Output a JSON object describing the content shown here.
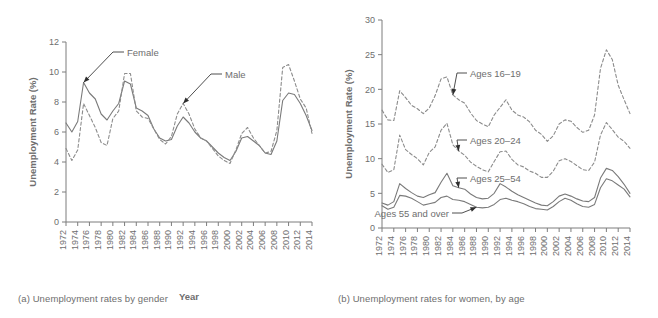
{
  "figure": {
    "panels": [
      {
        "id": "a",
        "caption": "(a) Unemployment rates by gender"
      },
      {
        "id": "b",
        "caption": "(b) Unemployment rates for women, by age"
      }
    ]
  },
  "chart_data": [
    {
      "type": "line",
      "panel": "a",
      "title": "(a) Unemployment rates by gender",
      "xlabel": "Year",
      "ylabel": "Unemployment Rate (%)",
      "xlim": [
        1972,
        2014
      ],
      "ylim": [
        0,
        12
      ],
      "yticks": [
        0,
        2,
        4,
        6,
        8,
        10,
        12
      ],
      "xticks": [
        1972,
        1974,
        1976,
        1978,
        1980,
        1982,
        1984,
        1986,
        1988,
        1990,
        1992,
        1994,
        1996,
        1998,
        2000,
        2002,
        2004,
        2006,
        2008,
        2010,
        2012,
        2014
      ],
      "grid": false,
      "legend": "inline-annotations",
      "annotations": [
        {
          "text": "Female",
          "series": "Female",
          "year": 1975
        },
        {
          "text": "Male",
          "series": "Male",
          "year": 1992
        }
      ],
      "x": [
        1972,
        1973,
        1974,
        1975,
        1976,
        1977,
        1978,
        1979,
        1980,
        1981,
        1982,
        1983,
        1984,
        1985,
        1986,
        1987,
        1988,
        1989,
        1990,
        1991,
        1992,
        1993,
        1994,
        1995,
        1996,
        1997,
        1998,
        1999,
        2000,
        2001,
        2002,
        2003,
        2004,
        2005,
        2006,
        2007,
        2008,
        2009,
        2010,
        2011,
        2012,
        2013,
        2014
      ],
      "series": [
        {
          "name": "Female",
          "style": "solid",
          "values": [
            6.6,
            6.0,
            6.7,
            9.3,
            8.6,
            8.2,
            7.2,
            6.8,
            7.4,
            7.9,
            9.4,
            9.2,
            7.6,
            7.4,
            7.1,
            6.2,
            5.6,
            5.4,
            5.5,
            6.4,
            7.0,
            6.6,
            6.0,
            5.6,
            5.4,
            5.0,
            4.6,
            4.3,
            4.1,
            4.7,
            5.6,
            5.7,
            5.4,
            5.1,
            4.6,
            4.5,
            5.4,
            8.1,
            8.6,
            8.5,
            7.9,
            7.1,
            6.1
          ]
        },
        {
          "name": "Male",
          "style": "dashed",
          "values": [
            4.9,
            4.1,
            4.8,
            7.9,
            7.1,
            6.3,
            5.3,
            5.1,
            6.9,
            7.4,
            9.9,
            9.9,
            7.4,
            7.0,
            6.9,
            6.2,
            5.5,
            5.2,
            5.7,
            7.2,
            7.9,
            7.2,
            6.2,
            5.6,
            5.4,
            4.9,
            4.4,
            4.1,
            3.9,
            4.8,
            5.9,
            6.3,
            5.6,
            5.1,
            4.6,
            4.7,
            6.1,
            10.3,
            10.5,
            9.4,
            8.2,
            7.6,
            5.9
          ]
        }
      ]
    },
    {
      "type": "line",
      "panel": "b",
      "title": "(b) Unemployment rates for women, by age",
      "xlabel": "Year",
      "ylabel": "Unemployment Rate (%)",
      "xlim": [
        1972,
        2014
      ],
      "ylim": [
        0,
        30
      ],
      "yticks": [
        0,
        5,
        10,
        15,
        20,
        25,
        30
      ],
      "xticks": [
        1972,
        1974,
        1976,
        1978,
        1980,
        1982,
        1984,
        1986,
        1988,
        1990,
        1992,
        1994,
        1996,
        1998,
        2000,
        2002,
        2004,
        2006,
        2008,
        2010,
        2012,
        2014
      ],
      "grid": false,
      "legend": "inline-annotations",
      "annotations": [
        {
          "text": "Ages 16–19",
          "series": "Ages 16–19",
          "year": 1984
        },
        {
          "text": "Ages 20–24",
          "series": "Ages 20–24",
          "year": 1985
        },
        {
          "text": "Ages 25–54",
          "series": "Ages 25–54",
          "year": 1985
        },
        {
          "text": "Ages 55 and over",
          "series": "Ages 55 and over",
          "year": 1988
        }
      ],
      "x": [
        1972,
        1973,
        1974,
        1975,
        1976,
        1977,
        1978,
        1979,
        1980,
        1981,
        1982,
        1983,
        1984,
        1985,
        1986,
        1987,
        1988,
        1989,
        1990,
        1991,
        1992,
        1993,
        1994,
        1995,
        1996,
        1997,
        1998,
        1999,
        2000,
        2001,
        2002,
        2003,
        2004,
        2005,
        2006,
        2007,
        2008,
        2009,
        2010,
        2011,
        2012,
        2013,
        2014
      ],
      "series": [
        {
          "name": "Ages 16–19",
          "style": "dashed",
          "values": [
            17.0,
            15.6,
            15.5,
            19.8,
            18.8,
            17.7,
            17.2,
            16.5,
            17.3,
            19.1,
            21.5,
            21.8,
            19.2,
            18.5,
            18.0,
            16.6,
            15.5,
            15.0,
            14.6,
            16.3,
            17.4,
            18.5,
            17.0,
            16.3,
            16.0,
            15.3,
            14.1,
            13.5,
            12.5,
            13.3,
            15.0,
            15.6,
            15.4,
            14.5,
            13.8,
            14.1,
            16.3,
            23.0,
            25.7,
            24.3,
            20.6,
            18.5,
            16.5
          ]
        },
        {
          "name": "Ages 20–24",
          "style": "dashed",
          "values": [
            9.2,
            8.0,
            8.4,
            13.4,
            11.3,
            10.6,
            10.0,
            9.1,
            10.9,
            11.7,
            14.1,
            15.1,
            12.0,
            11.1,
            10.5,
            9.5,
            8.9,
            8.4,
            8.1,
            9.6,
            11.0,
            11.1,
            9.9,
            9.1,
            8.8,
            8.2,
            7.9,
            7.3,
            7.3,
            8.2,
            9.7,
            10.0,
            9.6,
            9.0,
            8.4,
            8.3,
            9.5,
            13.4,
            15.2,
            14.2,
            13.1,
            12.5,
            11.5
          ]
        },
        {
          "name": "Ages 25–54",
          "style": "solid",
          "values": [
            3.6,
            3.3,
            3.8,
            6.4,
            5.7,
            5.1,
            4.6,
            4.4,
            4.8,
            5.1,
            6.6,
            7.9,
            6.1,
            5.8,
            5.6,
            4.9,
            4.4,
            4.2,
            4.3,
            5.0,
            6.4,
            5.9,
            5.3,
            4.8,
            4.4,
            4.0,
            3.6,
            3.3,
            3.2,
            3.8,
            4.6,
            4.9,
            4.6,
            4.2,
            3.9,
            3.8,
            4.4,
            7.2,
            8.6,
            8.3,
            7.4,
            6.3,
            5.0
          ]
        },
        {
          "name": "Ages 55 and over",
          "style": "solid",
          "values": [
            3.2,
            2.7,
            3.0,
            4.7,
            4.6,
            4.3,
            3.8,
            3.3,
            3.5,
            3.7,
            4.4,
            4.6,
            4.1,
            4.0,
            3.8,
            3.4,
            3.0,
            2.9,
            3.0,
            3.4,
            4.1,
            4.3,
            4.0,
            3.8,
            3.5,
            3.1,
            2.8,
            2.7,
            2.6,
            3.1,
            3.8,
            4.3,
            4.0,
            3.5,
            3.1,
            3.0,
            3.4,
            5.8,
            7.1,
            6.8,
            6.2,
            5.6,
            4.5
          ]
        }
      ]
    }
  ]
}
